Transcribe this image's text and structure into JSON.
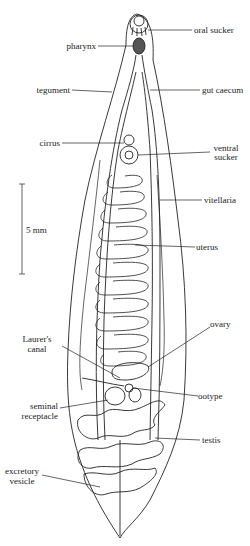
{
  "labels": {
    "oral_sucker": "oral sucker",
    "pharynx": "pharynx",
    "tegument": "tegument",
    "gut_caecum": "gut caecum",
    "cirrus": "cirrus",
    "ventral_sucker_1": "ventral",
    "ventral_sucker_2": "sucker",
    "vitellaria": "vitellaria",
    "scale": "5 mm",
    "uterus": "uterus",
    "ovary": "ovary",
    "laurers_canal_1": "Laurer's",
    "laurers_canal_2": "canal",
    "ootype": "ootype",
    "seminal_receptacle_1": "seminal",
    "seminal_receptacle_2": "receptacle",
    "testis": "testis",
    "excretory_vesicle_1": "excretory",
    "excretory_vesicle_2": "vesicle"
  },
  "colors": {
    "line": "#222222",
    "background": "#ffffff"
  }
}
